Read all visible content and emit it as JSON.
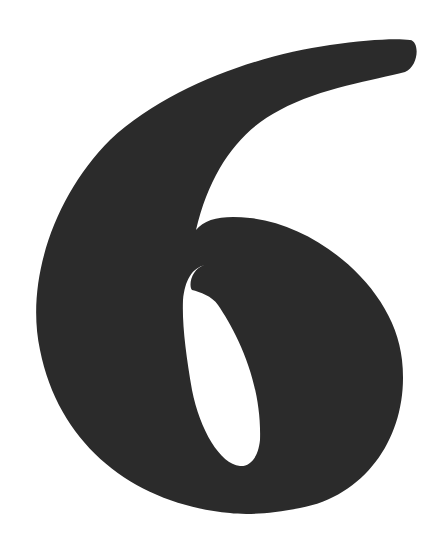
{
  "image": {
    "subject": "Numeral six glyph",
    "glyph": "6",
    "colors": {
      "background": "#ffffff",
      "ink": "#2b2b2b"
    }
  }
}
